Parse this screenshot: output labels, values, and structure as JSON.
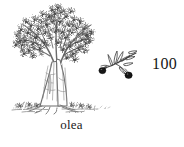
{
  "figure": {
    "kind": "botanical-illustration",
    "medium": "pen-and-ink line engraving",
    "background_color": "#ffffff",
    "ink_color": "#2b2b2b",
    "subject_label": "olive tree"
  },
  "tree": {
    "name": "olive-tree-illustration",
    "description": "Gnarled olive tree with broad stippled canopy, twisted multi-ridged trunk, exposed surface roots and tufts of ground vegetation at the base",
    "canopy_color": "#4a4a4a",
    "trunk_color": "#6f6f6f",
    "ground_color": "#7a7a7a"
  },
  "branch": {
    "name": "olive-branch-detail",
    "description": "Detached sprig of olive with narrow lanceolate leaves and two ripe drupes",
    "fruit_count": 2,
    "fruit_color": "#111111",
    "leaf_color": "#3d3d3d"
  },
  "caption": {
    "text": "olea"
  },
  "plate": {
    "number": "100"
  }
}
